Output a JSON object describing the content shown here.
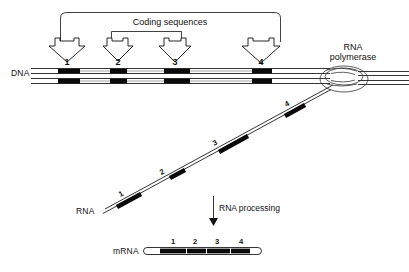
{
  "figure": {
    "title_text": "Coding sequences",
    "rna_processing_label": "RNA processing",
    "polymerase_label_line1": "RNA",
    "polymerase_label_line2": "polymerase",
    "row_labels": {
      "dna": "DNA",
      "rna": "RNA",
      "mrna": "mRNA"
    },
    "segment_numbers": [
      "1",
      "2",
      "3",
      "4"
    ],
    "colors": {
      "ink": "#111111",
      "band": "#0a0a0a",
      "background": "#ffffff",
      "bubble_stroke": "#333333"
    }
  },
  "dna": {
    "label": "DNA",
    "strand_left_x": 30,
    "strand_right_x": 409,
    "numbers": [
      "1",
      "2",
      "3",
      "4"
    ],
    "number_positions_x": [
      67,
      118,
      175,
      261
    ],
    "coding_bands_x": [
      {
        "n": "1",
        "start": 58,
        "end": 80
      },
      {
        "n": "2",
        "start": 110,
        "end": 127
      },
      {
        "n": "3",
        "start": 164,
        "end": 190
      },
      {
        "n": "4",
        "start": 252,
        "end": 272
      }
    ]
  },
  "coding_arrows": {
    "bracket_label": "Coding sequences",
    "arrow_tip_x": [
      67,
      118,
      175,
      261
    ],
    "outer_bracket": {
      "left_x": 58,
      "right_x": 283,
      "top_y": 13
    },
    "inner_bracket": {
      "left_x": 90,
      "right_x": 222,
      "top_y": 29
    }
  },
  "rna": {
    "label": "RNA",
    "numbers": [
      "1",
      "2",
      "3",
      "4"
    ],
    "start_point": {
      "x": 104,
      "y": 211
    },
    "end_point": {
      "x": 330,
      "y": 88
    },
    "segments": [
      {
        "n": "1",
        "t0": 0.06,
        "t1": 0.17
      },
      {
        "n": "2",
        "t0": 0.29,
        "t1": 0.36
      },
      {
        "n": "3",
        "t0": 0.51,
        "t1": 0.63
      },
      {
        "n": "4",
        "t0": 0.8,
        "t1": 0.89
      }
    ]
  },
  "polymerase": {
    "label_line1": "RNA",
    "label_line2": "polymerase",
    "center": {
      "x": 344,
      "y": 79
    }
  },
  "processing": {
    "label": "RNA processing",
    "arrow_x": 213,
    "arrow_top_y": 196,
    "arrow_bottom_y": 224
  },
  "mrna": {
    "label": "mRNA",
    "numbers": [
      "1",
      "2",
      "3",
      "4"
    ],
    "number_positions_x": [
      173,
      195,
      217,
      241
    ],
    "bar": {
      "left": 143,
      "right": 262,
      "y": 251
    },
    "coding_bands_x": [
      {
        "n": "1",
        "start": 160,
        "end": 186
      },
      {
        "n": "2",
        "start": 187,
        "end": 206
      },
      {
        "n": "3",
        "start": 207,
        "end": 230
      },
      {
        "n": "4",
        "start": 231,
        "end": 250
      }
    ]
  }
}
